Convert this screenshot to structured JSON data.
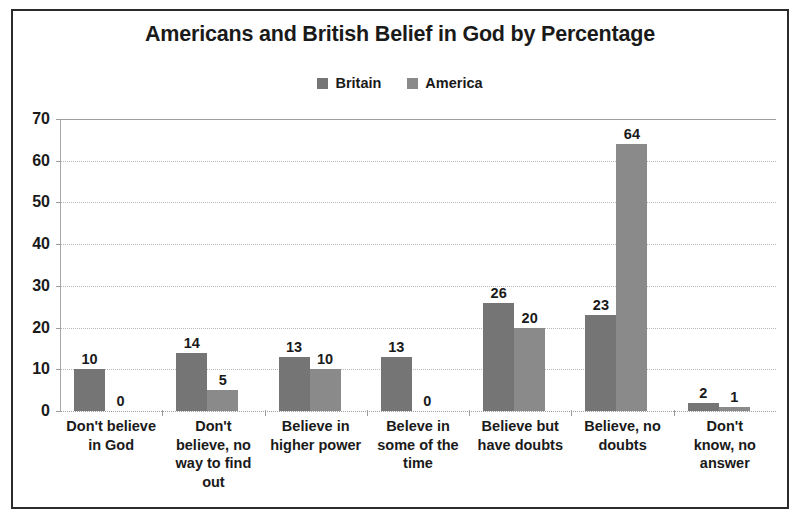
{
  "chart_data": {
    "type": "bar",
    "title": "Americans and British Belief in God by Percentage",
    "xlabel": "",
    "ylabel": "",
    "ylim": [
      0,
      70
    ],
    "yticks": [
      0,
      10,
      20,
      30,
      40,
      50,
      60,
      70
    ],
    "grid": true,
    "legend_position": "top-center",
    "categories": [
      "Don't believe in God",
      "Don't believe, no way to find out",
      "Believe in higher power",
      "Beleve in some of the time",
      "Believe but have doubts",
      "Believe, no doubts",
      "Don't know, no answer"
    ],
    "category_lines": [
      [
        "Don't believe",
        "in God"
      ],
      [
        "Don't",
        "believe, no",
        "way to find",
        "out"
      ],
      [
        "Believe in",
        "higher power"
      ],
      [
        "Beleve in",
        "some of the",
        "time"
      ],
      [
        "Believe but",
        "have doubts"
      ],
      [
        "Believe, no",
        "doubts"
      ],
      [
        "Don't",
        "know, no",
        "answer"
      ]
    ],
    "series": [
      {
        "name": "Britain",
        "color": "#757575",
        "values": [
          10,
          14,
          13,
          13,
          26,
          23,
          2
        ]
      },
      {
        "name": "America",
        "color": "#8a8a8a",
        "values": [
          0,
          5,
          10,
          0,
          20,
          64,
          1
        ]
      }
    ]
  },
  "style": {
    "frame_color": "#2b2b2b",
    "text_color": "#1a1a1a",
    "gridline_color": "#b9b9b9",
    "axis_color": "#9d9d9d",
    "background": "#ffffff"
  }
}
